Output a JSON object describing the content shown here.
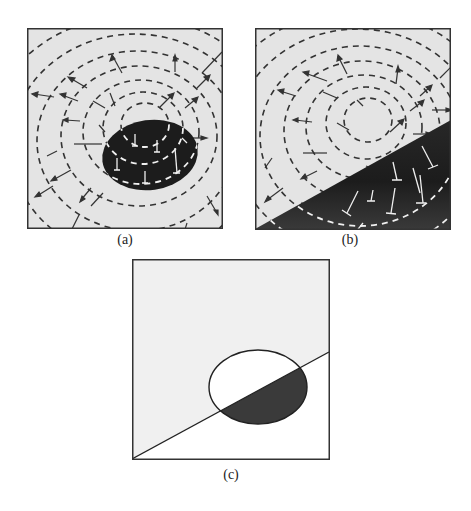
{
  "figure": {
    "panels": [
      {
        "id": "a",
        "label": "(a)",
        "description": "Level-set contours (dashed) with normal arrows around a dark elliptical region",
        "ellipse": {
          "cx": 123,
          "cy": 127,
          "rx": 48,
          "ry": 35,
          "rotate": -8,
          "fill": "#1a1a1a"
        },
        "contour_center": {
          "cx": 118,
          "cy": 97
        },
        "contour_radii": [
          22,
          36,
          52,
          70,
          90,
          112,
          136
        ]
      },
      {
        "id": "b",
        "label": "(b)",
        "description": "Level-set contours (dashed) with normal arrows; dark region below a diagonal line",
        "dark_region": {
          "from": [
            0,
            201
          ],
          "to": [
            195,
            93
          ],
          "fill": "#222222"
        },
        "contour_center": {
          "cx": 113,
          "cy": 92
        },
        "contour_radii": [
          22,
          36,
          52,
          70,
          90,
          112,
          136
        ]
      },
      {
        "id": "c",
        "label": "(c)",
        "description": "Ellipse intersected by a diagonal line; lower intersection shaded dark",
        "ellipse": {
          "cx": 126,
          "cy": 128,
          "rx": 49,
          "ry": 37
        },
        "line": {
          "from": [
            0,
            200
          ],
          "to": [
            197,
            93
          ]
        },
        "shade": "#333333"
      }
    ],
    "colors": {
      "panel_bg": "#e6e6e6",
      "panel_border": "#333333",
      "contour": "#333333",
      "contour_on_dark": "#f2f2f2",
      "dark_fill": "#1e1e1e"
    }
  }
}
